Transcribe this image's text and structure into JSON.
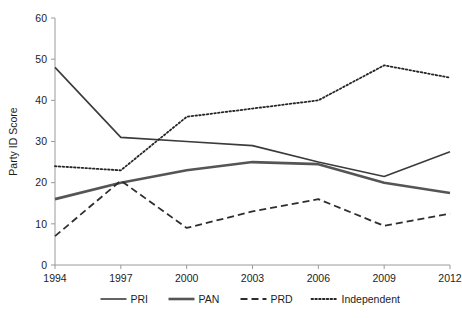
{
  "chart_data": {
    "type": "line",
    "title": "",
    "xlabel": "",
    "ylabel": "Party ID Score",
    "categories": [
      "1994",
      "1997",
      "2000",
      "2003",
      "2006",
      "2009",
      "2012"
    ],
    "x": [
      1994,
      1997,
      2000,
      2003,
      2006,
      2009,
      2012
    ],
    "xlim": [
      1994,
      2012
    ],
    "ylim": [
      0,
      60
    ],
    "yticks": [
      0,
      10,
      20,
      30,
      40,
      50,
      60
    ],
    "ytick_labels": [
      "0",
      "10",
      "20",
      "30",
      "40",
      "50",
      "60"
    ],
    "xtick_labels": [
      "1994",
      "1997",
      "2000",
      "2003",
      "2006",
      "2009",
      "2012"
    ],
    "grid": false,
    "legend_position": "bottom",
    "series": [
      {
        "name": "PRI",
        "style": "solid",
        "color": "#3b3b3b",
        "width": 1.6,
        "values": [
          48,
          31,
          30,
          29,
          25,
          21.5,
          27.5
        ]
      },
      {
        "name": "PAN",
        "style": "solid",
        "color": "#555555",
        "width": 2.6,
        "values": [
          16,
          20,
          23,
          25,
          24.5,
          20,
          17.5
        ]
      },
      {
        "name": "PRD",
        "style": "dashed",
        "color": "#2e2e2e",
        "width": 1.8,
        "values": [
          7,
          20.5,
          9,
          13,
          16,
          9.5,
          12.5
        ]
      },
      {
        "name": "Independent",
        "style": "dotted",
        "color": "#262626",
        "width": 1.8,
        "values": [
          24,
          23,
          36,
          38,
          40,
          48.5,
          45.5
        ]
      }
    ]
  },
  "legend": {
    "items": [
      {
        "label": "PRI"
      },
      {
        "label": "PAN"
      },
      {
        "label": "PRD"
      },
      {
        "label": "Independent"
      }
    ]
  },
  "colors": {
    "axis": "#9a9a9a",
    "text": "#1d1d1d",
    "background": "#ffffff"
  }
}
